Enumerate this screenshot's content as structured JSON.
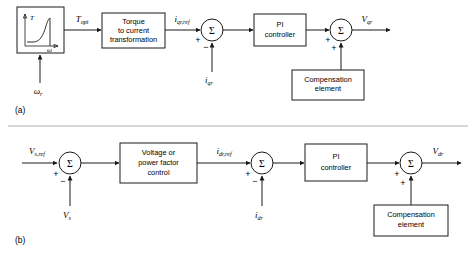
{
  "figure": {
    "captions": {
      "a": "(a)",
      "b": "(b)"
    },
    "colors": {
      "line": "#1a1a1a",
      "background": "#ffffff",
      "divider": "#9a9a9a"
    }
  },
  "diagram_a": {
    "caption": "(a)",
    "inset": {
      "y_axis_label": "T",
      "x_axis_label": "ω",
      "description": "torque versus speed characteristic curve"
    },
    "input_below_label": "ω",
    "input_below_sub": "r",
    "signal_1": {
      "base": "T",
      "sub": "opt"
    },
    "block_1": {
      "line1": "Torque",
      "line2": "to current",
      "line3": "transformation"
    },
    "signal_2": {
      "base": "i",
      "sub": "qr,ref"
    },
    "summing_1": {
      "symbol": "Σ",
      "sign_in": "+",
      "sign_feedback": "−"
    },
    "feedback_1": {
      "base": "i",
      "sub": "qr"
    },
    "block_2": {
      "line1": "PI",
      "line2": "controller"
    },
    "summing_2": {
      "symbol": "Σ",
      "sign_in": "+",
      "sign_comp": "+"
    },
    "block_3": {
      "line1": "Compensation",
      "line2": "element"
    },
    "output": {
      "base": "V",
      "sub": "qr"
    }
  },
  "diagram_b": {
    "caption": "(b)",
    "input": {
      "base": "V",
      "sub": "s,ref"
    },
    "summing_1": {
      "symbol": "Σ",
      "sign_in": "+",
      "sign_feedback": "−"
    },
    "feedback_1": {
      "base": "V",
      "sub": "s"
    },
    "block_1": {
      "line1": "Voltage or",
      "line2": "power factor",
      "line3": "control"
    },
    "signal_1": {
      "base": "i",
      "sub": "dr,ref"
    },
    "summing_2": {
      "symbol": "Σ",
      "sign_in": "+",
      "sign_feedback": "−"
    },
    "feedback_2": {
      "base": "i",
      "sub": "dr"
    },
    "block_2": {
      "line1": "PI",
      "line2": "controller"
    },
    "summing_3": {
      "symbol": "Σ",
      "sign_in": "+",
      "sign_comp": "+"
    },
    "block_3": {
      "line1": "Compensation",
      "line2": "element"
    },
    "output": {
      "base": "V",
      "sub": "dr"
    }
  }
}
